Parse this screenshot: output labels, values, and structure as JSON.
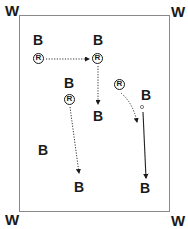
{
  "diagram": {
    "corners": {
      "top_left": "W",
      "top_right": "W",
      "bottom_left": "W",
      "bottom_right": "W"
    },
    "players": [
      {
        "id": "b1",
        "label": "B",
        "x": 37,
        "y": 34
      },
      {
        "id": "b2",
        "label": "B",
        "x": 98,
        "y": 34
      },
      {
        "id": "b3",
        "label": "B",
        "x": 65,
        "y": 77
      },
      {
        "id": "b4",
        "label": "B",
        "x": 93,
        "y": 110
      },
      {
        "id": "b5",
        "label": "B",
        "x": 140,
        "y": 89
      },
      {
        "id": "b6",
        "label": "B",
        "x": 38,
        "y": 143
      },
      {
        "id": "b7",
        "label": "B",
        "x": 74,
        "y": 181
      },
      {
        "id": "b8",
        "label": "B",
        "x": 139,
        "y": 182
      }
    ],
    "receivers": [
      {
        "id": "r1",
        "label": "R",
        "x": 33,
        "y": 53
      },
      {
        "id": "r2",
        "label": "R",
        "x": 92,
        "y": 53
      },
      {
        "id": "r3",
        "label": "R",
        "x": 63,
        "y": 94
      },
      {
        "id": "r4",
        "label": "R",
        "x": 113,
        "y": 79
      }
    ],
    "paths": [
      {
        "from": "r1",
        "to": "r2",
        "style": "dotted",
        "description": "horizontal pass right"
      },
      {
        "from": "r2",
        "to": "b4",
        "style": "dotted",
        "description": "vertical run down"
      },
      {
        "from": "r3",
        "to": "b7",
        "style": "dotted",
        "description": "diagonal run down"
      },
      {
        "from": "r4",
        "to": "b5-area",
        "style": "dotted",
        "description": "curved run down-right"
      },
      {
        "from": "b5",
        "to": "b8",
        "style": "solid",
        "description": "straight run down"
      }
    ],
    "markers": [
      {
        "id": "small-dot",
        "x": 142,
        "y": 107
      }
    ]
  }
}
